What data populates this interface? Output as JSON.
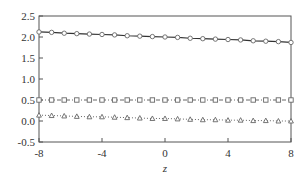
{
  "chart_data": {
    "type": "line",
    "title": "",
    "xlabel": "z",
    "ylabel": "",
    "xlim": [
      -8,
      8
    ],
    "ylim": [
      -0.5,
      2.5
    ],
    "x_ticks": [
      -8,
      -4,
      0,
      4,
      8
    ],
    "x_tick_labels": [
      "-8",
      "-4",
      "0",
      "4",
      "8"
    ],
    "y_ticks": [
      -0.5,
      0.0,
      0.5,
      1.0,
      1.5,
      2.0,
      2.5
    ],
    "y_tick_labels": [
      "-0.5",
      "0.0",
      "0.5",
      "1.0",
      "1.5",
      "2.0",
      "2.5"
    ],
    "grid": false,
    "legend": null,
    "x": [
      -8,
      -7.2,
      -6.4,
      -5.6,
      -4.8,
      -4,
      -3.2,
      -2.4,
      -1.6,
      -0.8,
      0,
      0.8,
      1.6,
      2.4,
      3.2,
      4,
      4.8,
      5.6,
      6.4,
      7.2,
      8
    ],
    "series": [
      {
        "name": "upper (circles, solid line)",
        "marker": "circle",
        "line_style": "solid",
        "values": [
          2.12,
          2.11,
          2.09,
          2.08,
          2.07,
          2.06,
          2.05,
          2.03,
          2.02,
          2.01,
          2.0,
          1.99,
          1.97,
          1.96,
          1.95,
          1.94,
          1.93,
          1.91,
          1.9,
          1.89,
          1.87
        ]
      },
      {
        "name": "middle (squares, dash-dot line)",
        "marker": "square",
        "line_style": "dashdot",
        "values": [
          0.5,
          0.5,
          0.5,
          0.5,
          0.5,
          0.5,
          0.5,
          0.5,
          0.5,
          0.5,
          0.5,
          0.5,
          0.5,
          0.5,
          0.5,
          0.5,
          0.5,
          0.5,
          0.5,
          0.5,
          0.5
        ]
      },
      {
        "name": "lower (triangles, dotted line)",
        "marker": "triangle",
        "line_style": "dotted",
        "values": [
          0.14,
          0.13,
          0.12,
          0.11,
          0.1,
          0.1,
          0.09,
          0.08,
          0.07,
          0.06,
          0.06,
          0.05,
          0.04,
          0.03,
          0.03,
          0.02,
          0.02,
          0.01,
          0.01,
          0.0,
          0.0
        ]
      }
    ]
  },
  "colors": {
    "axis": "#555555",
    "series": "#666666",
    "background": "#ffffff"
  },
  "layout": {
    "plot_left": 39,
    "plot_right": 291,
    "plot_top": 16,
    "plot_bottom": 142
  }
}
